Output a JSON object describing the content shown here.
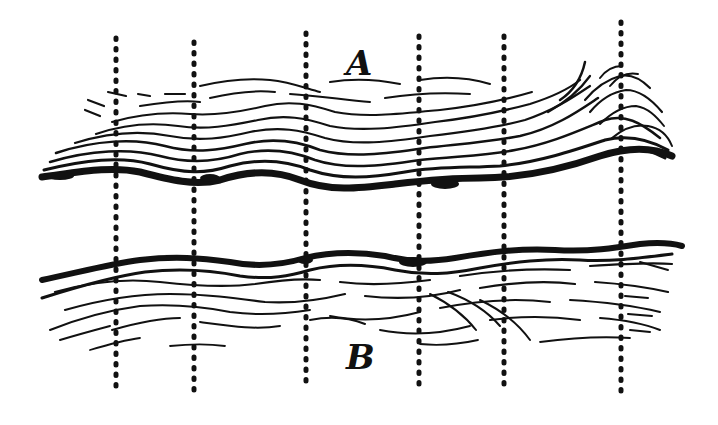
{
  "figure": {
    "labels": {
      "top": "A",
      "bottom": "B"
    },
    "colors": {
      "ink": "#111111",
      "background": "#ffffff"
    },
    "vertical_lines_x": [
      116,
      194,
      306,
      419,
      504,
      621
    ]
  }
}
